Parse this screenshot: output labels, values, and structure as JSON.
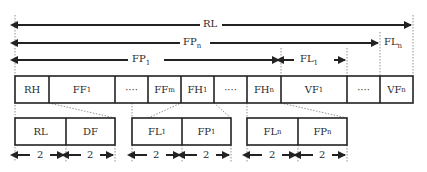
{
  "diagram": {
    "top_arrows": [
      {
        "label": "RL",
        "sub": "",
        "from_x": 16,
        "to_x": 412,
        "y": 25,
        "label_x": 207,
        "direction": "both"
      },
      {
        "label": "FP",
        "sub": "n",
        "from_x": 16,
        "to_x": 380,
        "y": 43,
        "label_x": 190,
        "direction": "both"
      },
      {
        "label": "FP",
        "sub": "1",
        "from_x": 16,
        "to_x": 281,
        "y": 60,
        "label_x": 133,
        "direction": "both"
      },
      {
        "label": "FL",
        "sub": "1",
        "from_x": 281,
        "to_x": 347,
        "y": 60,
        "label_x": 300,
        "direction": "both"
      }
    ],
    "side_label": {
      "label": "FL",
      "sub": "n",
      "x": 383,
      "y": 43
    },
    "main_row": [
      {
        "label": "RH",
        "sub": "",
        "x": 15,
        "w": 34
      },
      {
        "label": "FF",
        "sub": "1",
        "x": 49,
        "w": 66
      },
      {
        "label": "····",
        "sub": "",
        "x": 115,
        "w": 33
      },
      {
        "label": "FF",
        "sub": "m",
        "x": 148,
        "w": 33
      },
      {
        "label": "FH",
        "sub": "1",
        "x": 181,
        "w": 33
      },
      {
        "label": "····",
        "sub": "",
        "x": 214,
        "w": 33
      },
      {
        "label": "FH",
        "sub": "n",
        "x": 247,
        "w": 34
      },
      {
        "label": "VF",
        "sub": "1",
        "x": 281,
        "w": 66
      },
      {
        "label": "····",
        "sub": "",
        "x": 347,
        "w": 33
      },
      {
        "label": "VF",
        "sub": "n",
        "x": 380,
        "w": 33
      }
    ],
    "sub_groups": [
      {
        "expands": "RH",
        "cells": [
          {
            "label": "RL",
            "sub": ""
          },
          {
            "label": "DF",
            "sub": ""
          }
        ],
        "x": 15,
        "w": 100
      },
      {
        "expands": "FH1",
        "cells": [
          {
            "label": "FL",
            "sub": "1"
          },
          {
            "label": "FP",
            "sub": "1"
          }
        ],
        "x": 132,
        "w": 99
      },
      {
        "expands": "FHn",
        "cells": [
          {
            "label": "FL",
            "sub": "n"
          },
          {
            "label": "FP",
            "sub": "n"
          }
        ],
        "x": 247,
        "w": 100
      }
    ],
    "size_label": "2"
  }
}
